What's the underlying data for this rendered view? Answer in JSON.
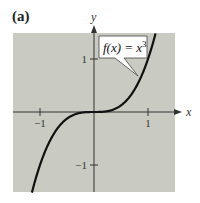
{
  "panel_label": "(a)",
  "chart_data": {
    "type": "line",
    "title": "",
    "function": "f(x) = x^3",
    "annotation": "f(x) = x³",
    "xlabel": "x",
    "ylabel": "y",
    "xlim": [
      -1.5,
      1.5
    ],
    "ylim": [
      -1.5,
      1.5
    ],
    "x_ticks": [
      {
        "value": -1,
        "label": "−1"
      },
      {
        "value": 1,
        "label": "1"
      }
    ],
    "y_ticks": [
      {
        "value": 1,
        "label": "1"
      },
      {
        "value": -1,
        "label": "−1"
      }
    ],
    "grid": false,
    "series": [
      {
        "name": "f(x) = x^3",
        "x": [
          -1.15,
          -1.0,
          -0.8,
          -0.6,
          -0.4,
          -0.2,
          0,
          0.2,
          0.4,
          0.6,
          0.8,
          1.0,
          1.14
        ],
        "y": [
          -1.52,
          -1.0,
          -0.512,
          -0.216,
          -0.064,
          -0.008,
          0,
          0.008,
          0.064,
          0.216,
          0.512,
          1.0,
          1.48
        ]
      }
    ]
  },
  "colors": {
    "plot_background": "#c9cbc2",
    "curve": "#111111",
    "axes": "#333333",
    "callout_fill": "#ffffff"
  }
}
